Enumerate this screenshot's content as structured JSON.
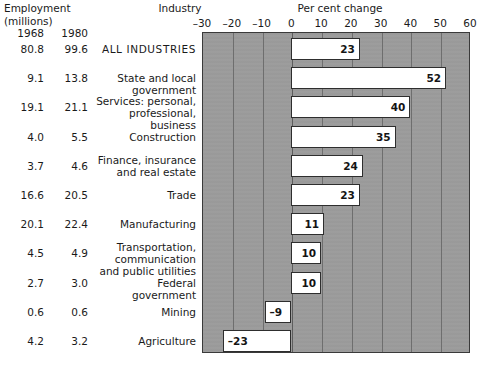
{
  "header": {
    "employment_title": "Employment",
    "employment_sub": "(millions)",
    "industry_title": "Industry",
    "axis_title": "Per cent change",
    "year_left": "1968",
    "year_right": "1980"
  },
  "axis": {
    "ticks": [
      "–30",
      "–20",
      "–10",
      "0",
      "10",
      "20",
      "30",
      "40",
      "50",
      "60"
    ],
    "tick_values": [
      -30,
      -20,
      -10,
      0,
      10,
      20,
      30,
      40,
      50,
      60
    ],
    "min": -30,
    "max": 60,
    "plot_bg": "#9b9b9b",
    "bar_fill": "#ffffff",
    "bar_stroke": "#2e2e2e"
  },
  "chart_data": {
    "type": "bar",
    "orientation": "horizontal",
    "title": "",
    "xlabel": "Per cent change",
    "ylabel": "Industry",
    "xlim": [
      -30,
      60
    ],
    "grid": true,
    "legend": "none",
    "categories": [
      "ALL  INDUSTRIES",
      "State and local government",
      "Services: personal,\nprofessional, business",
      "Construction",
      "Finance, insurance\nand real estate",
      "Trade",
      "Manufacturing",
      "Transportation, communication\nand public utilities",
      "Federal government",
      "Mining",
      "Agriculture"
    ],
    "values": [
      23,
      52,
      40,
      35,
      24,
      23,
      11,
      10,
      10,
      -9,
      -23
    ],
    "value_labels": [
      "23",
      "52",
      "40",
      "35",
      "24",
      "23",
      "11",
      "10",
      "10",
      "–9",
      "–23"
    ],
    "series": [
      {
        "name": "Per cent change 1968–1980",
        "values": [
          23,
          52,
          40,
          35,
          24,
          23,
          11,
          10,
          10,
          -9,
          -23
        ]
      },
      {
        "name": "Employment 1968 (millions)",
        "values": [
          80.8,
          9.1,
          19.1,
          4.0,
          3.7,
          16.6,
          20.1,
          4.5,
          2.7,
          0.6,
          4.2
        ]
      },
      {
        "name": "Employment 1980 (millions)",
        "values": [
          99.6,
          13.8,
          21.1,
          5.5,
          4.6,
          20.5,
          22.4,
          4.9,
          3.0,
          0.6,
          3.2
        ]
      }
    ]
  },
  "rows": [
    {
      "emp1968": "80.8",
      "emp1980": "99.6",
      "label_line1": "ALL  INDUSTRIES",
      "label_line2": "",
      "value_label": "23",
      "value": 23,
      "caps": true
    },
    {
      "emp1968": "9.1",
      "emp1980": "13.8",
      "label_line1": "State and local government",
      "label_line2": "",
      "value_label": "52",
      "value": 52,
      "caps": false
    },
    {
      "emp1968": "19.1",
      "emp1980": "21.1",
      "label_line1": "Services: personal,",
      "label_line2": "professional, business",
      "value_label": "40",
      "value": 40,
      "caps": false
    },
    {
      "emp1968": "4.0",
      "emp1980": "5.5",
      "label_line1": "Construction",
      "label_line2": "",
      "value_label": "35",
      "value": 35,
      "caps": false
    },
    {
      "emp1968": "3.7",
      "emp1980": "4.6",
      "label_line1": "Finance, insurance",
      "label_line2": "and real estate",
      "value_label": "24",
      "value": 24,
      "caps": false
    },
    {
      "emp1968": "16.6",
      "emp1980": "20.5",
      "label_line1": "Trade",
      "label_line2": "",
      "value_label": "23",
      "value": 23,
      "caps": false
    },
    {
      "emp1968": "20.1",
      "emp1980": "22.4",
      "label_line1": "Manufacturing",
      "label_line2": "",
      "value_label": "11",
      "value": 11,
      "caps": false
    },
    {
      "emp1968": "4.5",
      "emp1980": "4.9",
      "label_line1": "Transportation, communication",
      "label_line2": "and public utilities",
      "value_label": "10",
      "value": 10,
      "caps": false
    },
    {
      "emp1968": "2.7",
      "emp1980": "3.0",
      "label_line1": "Federal government",
      "label_line2": "",
      "value_label": "10",
      "value": 10,
      "caps": false
    },
    {
      "emp1968": "0.6",
      "emp1980": "0.6",
      "label_line1": "Mining",
      "label_line2": "",
      "value_label": "–9",
      "value": -9,
      "caps": false
    },
    {
      "emp1968": "4.2",
      "emp1980": "3.2",
      "label_line1": "Agriculture",
      "label_line2": "",
      "value_label": "–23",
      "value": -23,
      "caps": false
    }
  ]
}
